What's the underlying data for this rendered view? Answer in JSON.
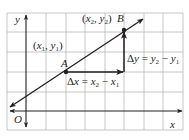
{
  "diagram": {
    "colors": {
      "grid": "#b8b8b8",
      "ink": "#231f20",
      "background": "#ffffff"
    },
    "axes": {
      "x_label": "x",
      "y_label": "y",
      "origin_label": "O"
    },
    "points": {
      "A": {
        "label": "A",
        "coord_label": "(x1, y1)"
      },
      "B": {
        "label": "B",
        "coord_label": "(x2, y2)"
      }
    },
    "annotations": {
      "delta_x": "Δx = x2 − x1",
      "delta_y": "Δy = y2 − y1"
    }
  }
}
